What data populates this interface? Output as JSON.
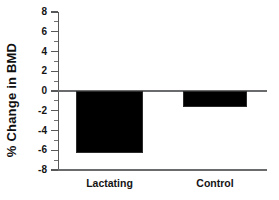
{
  "chart_data": {
    "type": "bar",
    "title": "",
    "xlabel": "",
    "ylabel": "% Change in BMD",
    "categories": [
      "Lactating",
      "Control"
    ],
    "values": [
      -6.3,
      -1.6
    ],
    "series": [
      {
        "name": "% Change in BMD",
        "values": [
          -6.3,
          -1.6
        ],
        "color": "#000000"
      }
    ],
    "ylim": [
      -8,
      8
    ],
    "ytick_labels": [
      "8",
      "6",
      "4",
      "2",
      "0",
      "-2",
      "-4",
      "-6",
      "-8"
    ],
    "ytick_values": [
      8,
      6,
      4,
      2,
      0,
      -2,
      -4,
      -6,
      -8
    ],
    "yminor_values": [
      7,
      5,
      3,
      1,
      -1,
      -3,
      -5,
      -7
    ],
    "grid": false,
    "legend": null,
    "zero_line": 0,
    "bar_color": "#000000",
    "axis_color": "#57585a"
  },
  "figure": {
    "background": "#ffffff"
  }
}
